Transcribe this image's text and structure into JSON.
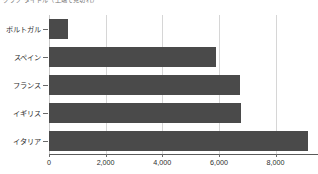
{
  "chart_data": {
    "type": "bar",
    "orientation": "horizontal",
    "title": "グラフ タイトル（上端で見切れ）",
    "title_truncated": true,
    "categories": [
      "ポルトガル",
      "スペイン",
      "フランス",
      "イギリス",
      "イタリア"
    ],
    "values": [
      670,
      5900,
      6750,
      6780,
      9140
    ],
    "series": [
      {
        "name": "値",
        "values": [
          670,
          5900,
          6750,
          6780,
          9140
        ]
      }
    ],
    "xlabel": "",
    "ylabel": "",
    "xlim": [
      0,
      9500
    ],
    "ylim": null,
    "xticks": [
      0,
      2000,
      4000,
      6000,
      8000
    ],
    "xtick_labels": [
      "0",
      "2,000",
      "4,000",
      "6,000",
      "8,000"
    ],
    "grid": "vertical",
    "legend": null,
    "legend_position": "none",
    "bar_color": "#4a4a4a",
    "gridline_color": "#d6d6d6",
    "axis_color": "#5a5a5a",
    "background": "#ffffff"
  }
}
